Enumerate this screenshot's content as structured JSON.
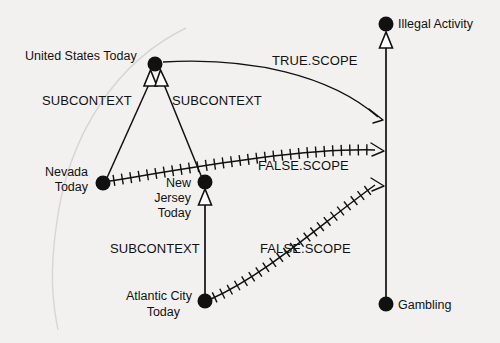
{
  "diagram": {
    "type": "node-link-graph",
    "background_color": "#f2f1ef",
    "ink_color": "#111111",
    "nodes": [
      {
        "id": "united_states_today",
        "label": "United States Today",
        "x": 155,
        "y": 64,
        "label_x": 25,
        "label_y": 60,
        "label_anchor": "start"
      },
      {
        "id": "illegal_activity",
        "label": "Illegal Activity",
        "x": 386,
        "y": 24,
        "label_x": 398,
        "label_y": 28,
        "label_anchor": "start"
      },
      {
        "id": "nevada_today",
        "label": "Nevada Today",
        "x": 103,
        "y": 183,
        "label_x": 90,
        "label_y": 176,
        "label_anchor": "end"
      },
      {
        "id": "new_jersey_today",
        "label": "New Jersey Today",
        "x": 205,
        "y": 182,
        "label_x": 193,
        "label_y": 188,
        "label_anchor": "end"
      },
      {
        "id": "atlantic_city_today",
        "label": "Atlantic City Today",
        "x": 205,
        "y": 301,
        "label_x": 193,
        "label_y": 300,
        "label_anchor": "end"
      },
      {
        "id": "gambling",
        "label": "Gambling",
        "x": 386,
        "y": 304,
        "label_x": 398,
        "label_y": 309,
        "label_anchor": "start"
      }
    ],
    "node_label_lines": {
      "united_states_today": [
        "United  States  Today"
      ],
      "illegal_activity": [
        "Illegal Activity"
      ],
      "nevada_today": [
        "Nevada",
        "Today"
      ],
      "new_jersey_today": [
        "New",
        "Jersey",
        "Today"
      ],
      "atlantic_city_today": [
        "Atlantic  City",
        "Today"
      ],
      "gambling": [
        "Gambling"
      ]
    },
    "edges": [
      {
        "id": "e-nevada-us",
        "label": "SUBCONTEXT",
        "from": "nevada_today",
        "to": "united_states_today",
        "style": "plain",
        "arrow": "hollow-triangle",
        "label_x": 42,
        "label_y": 105
      },
      {
        "id": "e-nj-us",
        "label": "SUBCONTEXT",
        "from": "new_jersey_today",
        "to": "united_states_today",
        "style": "plain",
        "arrow": "hollow-triangle",
        "label_x": 172,
        "label_y": 105
      },
      {
        "id": "e-ac-nj",
        "label": "SUBCONTEXT",
        "from": "atlantic_city_today",
        "to": "new_jersey_today",
        "style": "plain",
        "arrow": "hollow-triangle",
        "label_x": 110,
        "label_y": 253
      },
      {
        "id": "e-gambling-ia",
        "label": "",
        "from": "gambling",
        "to": "illegal_activity",
        "style": "plain",
        "arrow": "hollow-triangle",
        "label_x": 0,
        "label_y": 0
      },
      {
        "id": "e-us-true",
        "label": "TRUE.SCOPE",
        "from": "united_states_today",
        "to": "illegal_activity",
        "style": "curve",
        "arrow": "open-arrow",
        "label_x": 272,
        "label_y": 65
      },
      {
        "id": "e-nevada-false",
        "label": "FALSE.SCOPE",
        "from": "nevada_today",
        "to": "illegal_activity",
        "style": "hatched",
        "arrow": "open-arrow",
        "label_x": 258,
        "label_y": 170
      },
      {
        "id": "e-ac-false",
        "label": "FALSE.SCOPE",
        "from": "atlantic_city_today",
        "to": "illegal_activity",
        "style": "hatched",
        "arrow": "open-arrow",
        "label_x": 260,
        "label_y": 253
      }
    ],
    "arrow_targets_on_spine": [
      {
        "edge": "e-us-true",
        "x": 383,
        "y": 120
      },
      {
        "edge": "e-nevada-false",
        "x": 383,
        "y": 152
      },
      {
        "edge": "e-ac-false",
        "x": 383,
        "y": 186
      }
    ]
  }
}
